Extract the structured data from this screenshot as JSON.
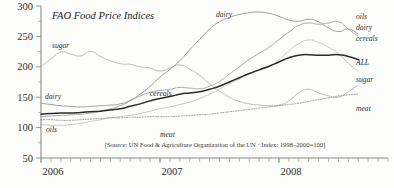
{
  "chart_data": {
    "type": "line",
    "title": "FAO Food Price Indices",
    "xlabel": "",
    "ylabel": "",
    "ylim": [
      50,
      300
    ],
    "yticks": [
      50,
      100,
      150,
      200,
      250,
      300
    ],
    "xticks": [
      "2006",
      "2007",
      "2008"
    ],
    "x_tick_interval": "monthly",
    "grid": false,
    "legend_position": "right-edge-inline",
    "source_note": "[Source: UN Food & Agriculture Organization of the UN · Index: 1998–2000=100]",
    "x": [
      "2006-01",
      "2006-02",
      "2006-03",
      "2006-04",
      "2006-05",
      "2006-06",
      "2006-07",
      "2006-08",
      "2006-09",
      "2006-10",
      "2006-11",
      "2006-12",
      "2007-01",
      "2007-02",
      "2007-03",
      "2007-04",
      "2007-05",
      "2007-06",
      "2007-07",
      "2007-08",
      "2007-09",
      "2007-10",
      "2007-11",
      "2007-12",
      "2008-01",
      "2008-02",
      "2008-03",
      "2008-04",
      "2008-05",
      "2008-06",
      "2008-07",
      "2008-08",
      "2008-09"
    ],
    "series": [
      {
        "name": "sugar",
        "color": "#b9b9b4",
        "width": 1.0,
        "dash": "none",
        "values": [
          200,
          213,
          224,
          221,
          218,
          225,
          217,
          210,
          205,
          204,
          200,
          198,
          193,
          198,
          203,
          196,
          186,
          172,
          160,
          150,
          143,
          139,
          137,
          136,
          137,
          144,
          157,
          163,
          157,
          152,
          150,
          159,
          170
        ]
      },
      {
        "name": "dairy",
        "color": "#9b9b96",
        "width": 1.0,
        "dash": "none",
        "values": [
          140,
          138,
          136,
          135,
          134,
          135,
          136,
          137,
          139,
          145,
          155,
          168,
          183,
          196,
          210,
          228,
          245,
          262,
          274,
          281,
          286,
          289,
          290,
          288,
          283,
          277,
          275,
          278,
          274,
          264,
          258,
          262,
          254
        ]
      },
      {
        "name": "cereals",
        "color": "#a8a8a3",
        "width": 1.0,
        "dash": "none",
        "values": [
          118,
          119,
          120,
          121,
          122,
          124,
          127,
          131,
          136,
          144,
          152,
          158,
          161,
          163,
          166,
          165,
          164,
          168,
          176,
          188,
          200,
          212,
          222,
          232,
          245,
          257,
          268,
          272,
          270,
          272,
          274,
          262,
          250
        ]
      },
      {
        "name": "oils",
        "color": "#c6c6c1",
        "width": 1.0,
        "dash": "none",
        "values": [
          105,
          104,
          104,
          105,
          107,
          110,
          113,
          116,
          118,
          120,
          123,
          127,
          131,
          134,
          138,
          142,
          148,
          155,
          163,
          172,
          180,
          188,
          194,
          200,
          212,
          226,
          238,
          244,
          240,
          232,
          222,
          206,
          192
        ]
      },
      {
        "name": "meat",
        "color": "#8e8e89",
        "width": 0.9,
        "dash": "1,1.6",
        "values": [
          113,
          113,
          112,
          112,
          113,
          114,
          115,
          116,
          116,
          117,
          117,
          118,
          118,
          118,
          119,
          120,
          121,
          122,
          124,
          126,
          128,
          130,
          132,
          134,
          136,
          138,
          140,
          143,
          146,
          149,
          152,
          154,
          155
        ]
      },
      {
        "name": "ALL",
        "color": "#2b2b29",
        "width": 1.5,
        "dash": "none",
        "values": [
          122,
          123,
          124,
          124,
          125,
          126,
          127,
          129,
          131,
          135,
          139,
          144,
          148,
          151,
          155,
          157,
          159,
          163,
          168,
          175,
          182,
          189,
          195,
          201,
          208,
          215,
          219,
          220,
          219,
          219,
          220,
          217,
          212
        ]
      }
    ],
    "inline_labels": [
      {
        "text": "sugar",
        "x": 52,
        "y": 48
      },
      {
        "text": "dairy",
        "x": 45,
        "y": 99
      },
      {
        "text": "oils",
        "x": 46,
        "y": 132
      },
      {
        "text": "cereals",
        "x": 150,
        "y": 96
      },
      {
        "text": "dairy",
        "x": 216,
        "y": 17
      },
      {
        "text": "meat",
        "x": 160,
        "y": 137
      }
    ],
    "legend_entries": [
      {
        "label": "oils",
        "y": 19,
        "emphasis": "normal"
      },
      {
        "label": "dairy",
        "y": 30,
        "emphasis": "normal"
      },
      {
        "label": "cereals",
        "y": 41,
        "emphasis": "normal"
      },
      {
        "label": "ALL",
        "y": 65,
        "emphasis": "bold"
      },
      {
        "label": "sugar",
        "y": 82,
        "emphasis": "normal"
      },
      {
        "label": "meat",
        "y": 111,
        "emphasis": "normal"
      }
    ]
  }
}
